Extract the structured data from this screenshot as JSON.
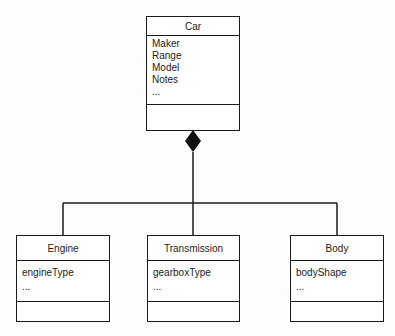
{
  "diagram": {
    "type": "UML class diagram",
    "relationship": "composition",
    "classes": [
      {
        "name": "Car",
        "attributes": [
          "Maker",
          "Range",
          "Model",
          "Notes",
          "..."
        ]
      },
      {
        "name": "Engine",
        "attributes": [
          "engineType",
          "..."
        ]
      },
      {
        "name": "Transmission",
        "attributes": [
          "gearboxType",
          "..."
        ]
      },
      {
        "name": "Body",
        "attributes": [
          "bodyShape",
          "..."
        ]
      }
    ]
  }
}
